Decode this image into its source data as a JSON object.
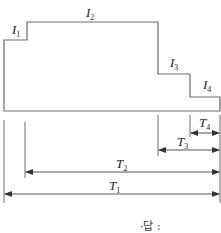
{
  "diagram": {
    "current_labels": [
      {
        "id": "I1",
        "base": "I",
        "sub": "1"
      },
      {
        "id": "I2",
        "base": "I",
        "sub": "2"
      },
      {
        "id": "I3",
        "base": "I",
        "sub": "3"
      },
      {
        "id": "I4",
        "base": "I",
        "sub": "4"
      }
    ],
    "time_labels": [
      {
        "id": "T4",
        "base": "T",
        "sub": "4"
      },
      {
        "id": "T3",
        "base": "T",
        "sub": "3"
      },
      {
        "id": "T2",
        "base": "T",
        "sub": "2"
      },
      {
        "id": "T1",
        "base": "T",
        "sub": "1"
      }
    ],
    "answer_label": "·답 :",
    "line_color": "#6b6b6b"
  }
}
